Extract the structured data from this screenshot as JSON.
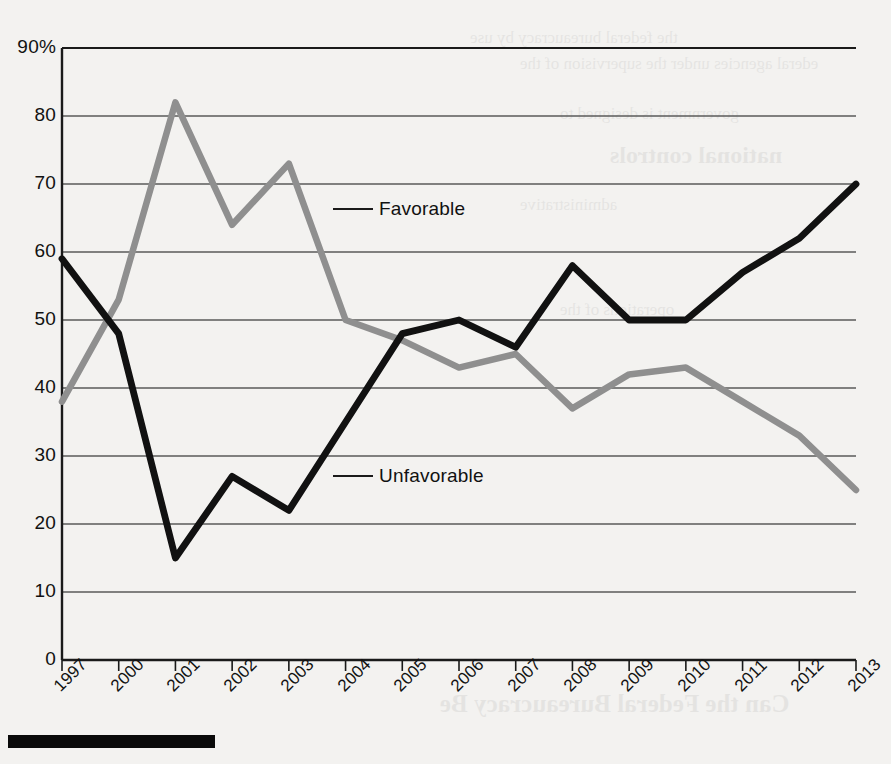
{
  "chart_data": {
    "type": "line",
    "title": "",
    "subtitle": "",
    "xlabel": "",
    "ylabel": "",
    "ylim": [
      0,
      90
    ],
    "grid": true,
    "legend_position": "inline-annotation",
    "y_ticks": [
      "0",
      "10",
      "20",
      "30",
      "40",
      "50",
      "60",
      "70",
      "80",
      "90%"
    ],
    "y_tick_values": [
      0,
      10,
      20,
      30,
      40,
      50,
      60,
      70,
      80,
      90
    ],
    "categories": [
      "1997",
      "2000",
      "2001",
      "2002",
      "2003",
      "2004",
      "2005",
      "2006",
      "2007",
      "2008",
      "2009",
      "2010",
      "2011",
      "2012",
      "2013"
    ],
    "series": [
      {
        "name": "Favorable",
        "color": "#8f8f8f",
        "values": [
          38,
          53,
          82,
          64,
          73,
          50,
          47,
          43,
          45,
          37,
          42,
          43,
          38,
          33,
          25
        ]
      },
      {
        "name": "Unfavorable",
        "color": "#111111",
        "values": [
          59,
          48,
          15,
          27,
          22,
          35,
          48,
          50,
          46,
          58,
          50,
          50,
          57,
          62,
          70
        ]
      }
    ],
    "annotations": [
      {
        "text": "Favorable",
        "series": "Favorable",
        "category": "2003"
      },
      {
        "text": "Unfavorable",
        "series": "Unfavorable",
        "category": "2003"
      }
    ]
  },
  "colors": {
    "page_background": "#f3f2f0",
    "axis": "#1a1a1a",
    "gridline": "#5a5a5a",
    "favorable": "#8f8f8f",
    "unfavorable": "#111111",
    "rule": "#0a0a0a"
  },
  "bleed_text": {
    "lines": [
      "national controls",
      "the federal bureaucracy by use",
      "ederal agencies under the supervision of the",
      "operations of the",
      "government is designed to",
      "administrative",
      "Can the Federal Bureaucracy Be"
    ]
  }
}
